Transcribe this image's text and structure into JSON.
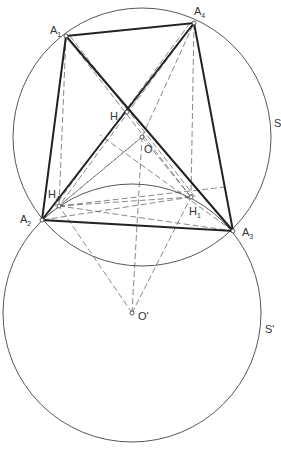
{
  "diagram": {
    "type": "geometry-construction",
    "points": {
      "A1": {
        "label": "A",
        "sub": "1",
        "x": 66,
        "y": 36
      },
      "A2": {
        "label": "A",
        "sub": "2",
        "x": 42,
        "y": 220
      },
      "A3": {
        "label": "A",
        "sub": "3",
        "x": 233,
        "y": 231
      },
      "A4": {
        "label": "A",
        "sub": "4",
        "x": 194,
        "y": 23
      },
      "H": {
        "label": "H",
        "x": 127,
        "y": 112
      },
      "O": {
        "label": "O",
        "x": 142,
        "y": 137
      },
      "H1": {
        "label": "H",
        "sub": "1",
        "x": 191,
        "y": 197
      },
      "H4": {
        "label": "H",
        "sub": "4",
        "x": 59,
        "y": 206
      },
      "Oprime": {
        "label": "O'",
        "x": 132,
        "y": 313
      }
    },
    "circles": [
      {
        "label": "S",
        "center": "O",
        "r": 129
      },
      {
        "label": "S'",
        "center": "Oprime",
        "r": 129
      }
    ],
    "labels": {
      "S": "S",
      "Sprime": "S'"
    }
  }
}
